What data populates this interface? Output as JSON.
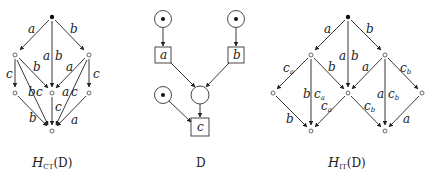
{
  "figures": {
    "left": {
      "caption_main": "H",
      "caption_sub": "CT",
      "caption_arg": "(D)",
      "labels": {
        "top_left": "a",
        "top_mid_a": "a",
        "top_mid_b": "b",
        "top_right": "b",
        "l_down": "c",
        "l_to_mid": "b",
        "r_to_mid": "a",
        "r_down": "c",
        "l_long": "b",
        "l_long_c": "c",
        "r_long_a": "a",
        "r_long_c": "c",
        "mid_down": "c",
        "bl": "b",
        "br": "a"
      }
    },
    "middle": {
      "caption": "D",
      "transitions": {
        "a": "a",
        "b": "b",
        "c": "c"
      }
    },
    "right": {
      "caption_main": "H",
      "caption_sub": "IT",
      "caption_arg": "(D)",
      "labels": {
        "top_left": "a",
        "top_mid_a": "a",
        "top_mid_b": "b",
        "top_right": "b",
        "ll_ca": "c",
        "ll_ca_sub": "a",
        "l_to_mid": "b",
        "r_to_mid": "a",
        "rr_cb": "c",
        "rr_cb_sub": "b",
        "l_vert_b": "b",
        "l_vert_c": "c",
        "l_vert_c_sub": "a",
        "r_vert_a": "a",
        "r_vert_c": "c",
        "r_vert_c_sub": "b",
        "mid_bl_c": "c",
        "mid_bl_c_sub": "a",
        "mid_br_c": "c",
        "mid_br_c_sub": "b",
        "ll_b": "b",
        "rr_a": "a"
      }
    }
  }
}
